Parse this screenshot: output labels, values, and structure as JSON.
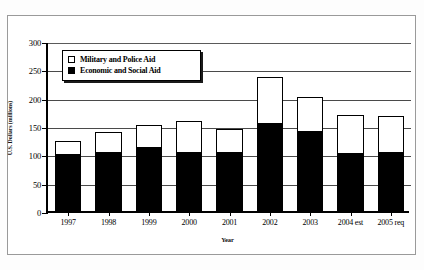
{
  "chart_data": {
    "type": "bar",
    "title": "",
    "subtitle": "",
    "xlabel": "Year",
    "ylabel": "U.S. Dollars (millions)",
    "stacked": true,
    "grid": true,
    "legend_position": "top-left-inside",
    "ylim": [
      0,
      300
    ],
    "yticks": [
      0,
      50,
      100,
      150,
      200,
      250,
      300
    ],
    "ytick_labels": [
      "0",
      "50",
      "100",
      "150",
      "200",
      "250",
      "300"
    ],
    "categories": [
      "1997",
      "1998",
      "1999",
      "2000",
      "2001",
      "2002",
      "2003",
      "2004 est",
      "2005 req"
    ],
    "series": [
      {
        "name": "Economic and Social Aid",
        "color": "#000000",
        "values": [
          99,
          103,
          112,
          103,
          103,
          154,
          140,
          101,
          103
        ]
      },
      {
        "name": "Military and Police Aid",
        "color": "#ffffff",
        "values": [
          25,
          37,
          39,
          55,
          41,
          82,
          62,
          69,
          65
        ]
      }
    ],
    "totals": [
      124,
      140,
      151,
      158,
      144,
      236,
      202,
      170,
      168
    ]
  },
  "legend": {
    "entries": [
      {
        "label": "Military and Police Aid",
        "swatch": "hollow"
      },
      {
        "label": "Economic and Social Aid",
        "swatch": "filled"
      }
    ]
  }
}
